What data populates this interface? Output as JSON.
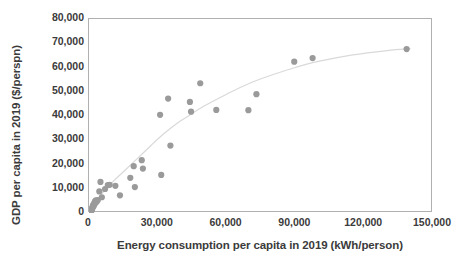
{
  "chart_data": {
    "type": "scatter",
    "title": "",
    "xlabel": "Energy consumption per capita in 2019 (kWh/person)",
    "ylabel": "GDP per capita in 2019 ($/perspn)",
    "xlim": [
      0,
      150000
    ],
    "ylim": [
      0,
      80000
    ],
    "xticks": [
      0,
      30000,
      60000,
      90000,
      120000,
      150000
    ],
    "xtick_labels": [
      "0",
      "30,000",
      "60,000",
      "90,000",
      "120,000",
      "150,000"
    ],
    "yticks": [
      0,
      10000,
      20000,
      30000,
      40000,
      50000,
      60000,
      70000,
      80000
    ],
    "ytick_labels": [
      "0",
      "10,000",
      "20,000",
      "30,000",
      "40,000",
      "50,000",
      "60,000",
      "70,000",
      "80,000"
    ],
    "grid": false,
    "legend": false,
    "marker": {
      "shape": "circle",
      "color": "#9a9a9a",
      "size": 3.1
    },
    "trendline": {
      "present": true,
      "style": "smooth-logarithmic",
      "color": "#d9d9d9",
      "width": 1.2,
      "points": [
        [
          1500,
          2000
        ],
        [
          5000,
          7200
        ],
        [
          10000,
          12500
        ],
        [
          15000,
          17000
        ],
        [
          20000,
          21500
        ],
        [
          25000,
          26000
        ],
        [
          30000,
          30500
        ],
        [
          35000,
          34500
        ],
        [
          40000,
          38000
        ],
        [
          45000,
          41000
        ],
        [
          50000,
          44000
        ],
        [
          60000,
          49000
        ],
        [
          70000,
          53500
        ],
        [
          80000,
          57000
        ],
        [
          90000,
          60000
        ],
        [
          100000,
          62500
        ],
        [
          115000,
          65200
        ],
        [
          130000,
          67000
        ],
        [
          140000,
          67800
        ]
      ]
    },
    "points": [
      [
        600,
        500
      ],
      [
        800,
        700
      ],
      [
        900,
        1100
      ],
      [
        1000,
        900
      ],
      [
        1100,
        1500
      ],
      [
        1200,
        1200
      ],
      [
        1300,
        2000
      ],
      [
        1400,
        1700
      ],
      [
        1600,
        2400
      ],
      [
        1700,
        3000
      ],
      [
        1900,
        2700
      ],
      [
        2000,
        3600
      ],
      [
        2200,
        3200
      ],
      [
        2400,
        4200
      ],
      [
        2600,
        4800
      ],
      [
        2800,
        4100
      ],
      [
        3000,
        5200
      ],
      [
        3300,
        4600
      ],
      [
        3800,
        5300
      ],
      [
        4500,
        8900
      ],
      [
        5000,
        12800
      ],
      [
        5600,
        6500
      ],
      [
        7000,
        9900
      ],
      [
        8200,
        11500
      ],
      [
        9000,
        11600
      ],
      [
        11500,
        11200
      ],
      [
        13500,
        7300
      ],
      [
        18000,
        14500
      ],
      [
        19500,
        19300
      ],
      [
        20000,
        10700
      ],
      [
        23000,
        21800
      ],
      [
        23500,
        18300
      ],
      [
        31000,
        40500
      ],
      [
        31500,
        15700
      ],
      [
        34500,
        47200
      ],
      [
        35500,
        27800
      ],
      [
        44000,
        45800
      ],
      [
        44500,
        41800
      ],
      [
        48500,
        53500
      ],
      [
        55500,
        42500
      ],
      [
        69500,
        42400
      ],
      [
        73000,
        49000
      ],
      [
        89500,
        62400
      ],
      [
        97500,
        63900
      ],
      [
        138500,
        67600
      ]
    ]
  }
}
